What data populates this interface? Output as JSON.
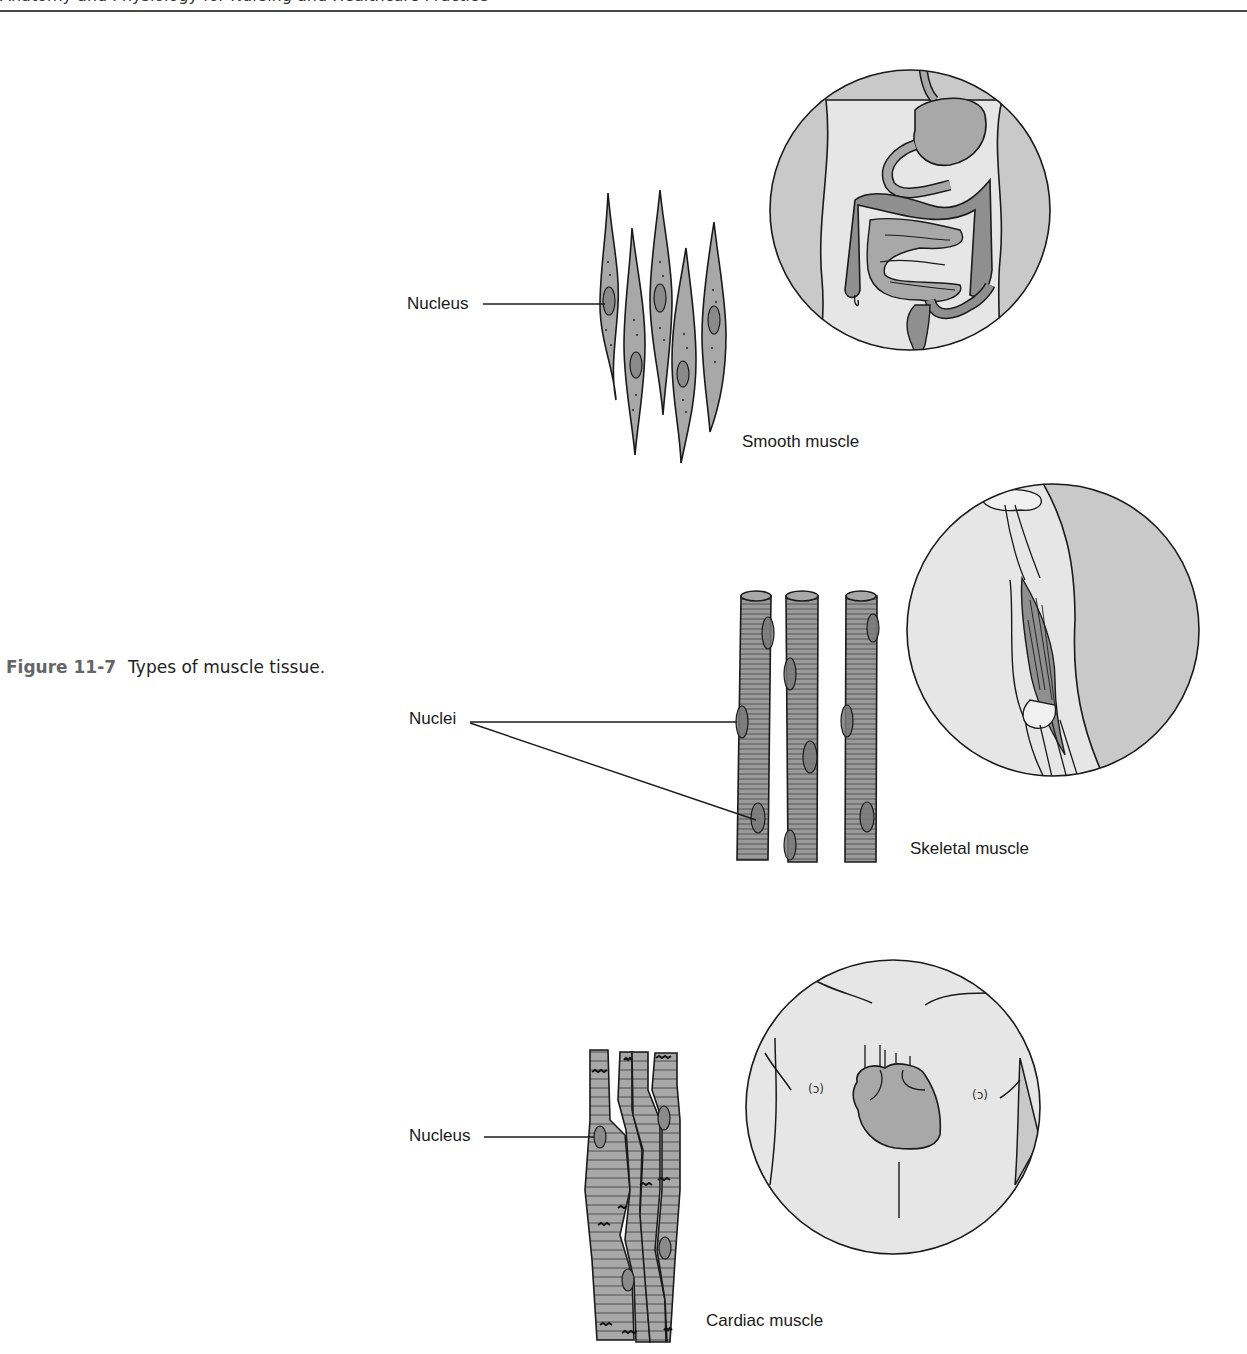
{
  "header": {
    "running_head": "Anatomy and Physiology for Nursing and Healthcare Practice"
  },
  "figure": {
    "number": "Figure 11-7",
    "caption": "Types of muscle tissue."
  },
  "panels": {
    "smooth": {
      "pointer_label": "Nucleus",
      "title": "Smooth muscle",
      "inset": "digestive-tract"
    },
    "skeletal": {
      "pointer_label": "Nuclei",
      "title": "Skeletal muscle",
      "inset": "upper-arm-biceps"
    },
    "cardiac": {
      "pointer_label": "Nucleus",
      "title": "Cardiac muscle",
      "inset": "chest-heart"
    }
  },
  "colors": {
    "ink": "#1a1a1a",
    "tissue_fill": "#a8a8a8",
    "body_fill": "#e6e6e6",
    "side_fill": "#c8c8c8",
    "caption_number": "#666666"
  }
}
